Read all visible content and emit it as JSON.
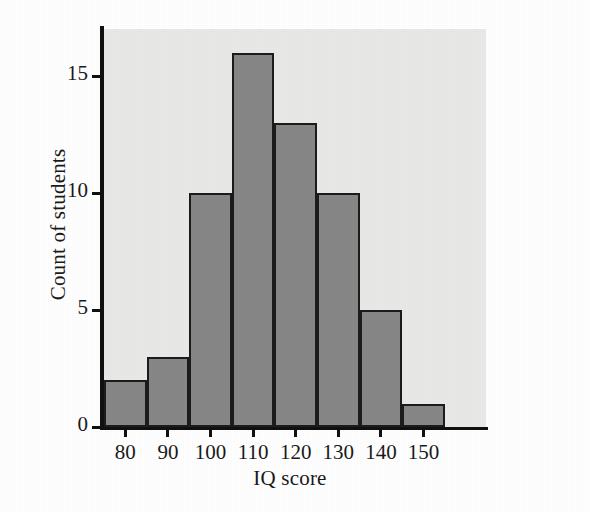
{
  "chart_data": {
    "type": "bar",
    "title": "",
    "subtitle": "",
    "xlabel": "IQ score",
    "ylabel": "Count of students",
    "categories": [
      "80",
      "90",
      "100",
      "110",
      "120",
      "130",
      "140",
      "150"
    ],
    "values": [
      2,
      3,
      10,
      16,
      13,
      10,
      5,
      1
    ],
    "bin_width": 10,
    "bin_edges": [
      75,
      85,
      95,
      105,
      115,
      125,
      135,
      145,
      155
    ],
    "xticks": [
      "80",
      "90",
      "100",
      "110",
      "120",
      "130",
      "140",
      "150"
    ],
    "yticks": [
      "0",
      "5",
      "10",
      "15"
    ],
    "ytick_values": [
      0,
      5,
      10,
      15
    ],
    "xlim": [
      73,
      158
    ],
    "ylim": [
      0,
      17
    ],
    "grid": false,
    "legend": null,
    "legend_position": "none",
    "annotations": [],
    "colors": {
      "bar_fill": "#878787",
      "bar_edge": "#1c1c1c",
      "plot_background": "#e9e9e7",
      "page_background": "#ffffff",
      "axis": "#111111",
      "text": "#1a1a1a"
    }
  }
}
